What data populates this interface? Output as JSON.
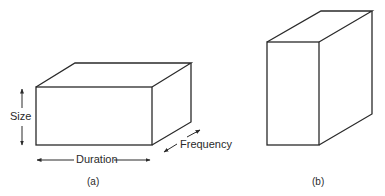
{
  "figure_a": {
    "caption": "(a)",
    "labels": {
      "size": "Size",
      "duration": "Duration",
      "frequency": "Frequency"
    },
    "shape": "wide rectangular box"
  },
  "figure_b": {
    "caption": "(b)",
    "shape": "tall deep rectangular box"
  },
  "colors": {
    "line": "#2a2a2a",
    "background": "#ffffff"
  }
}
